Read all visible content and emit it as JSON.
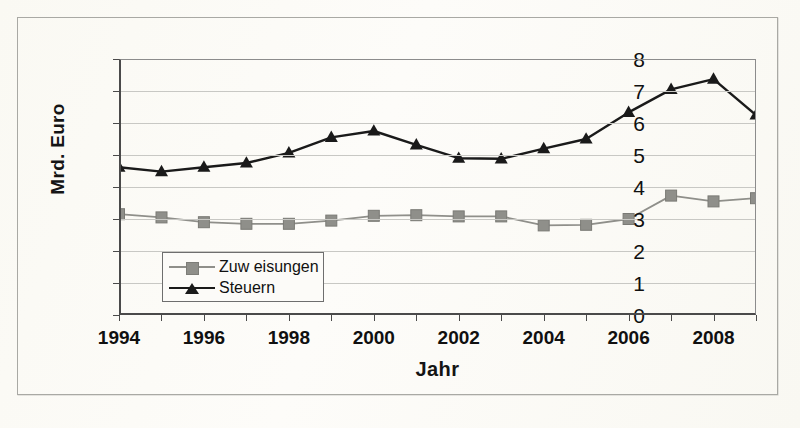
{
  "chart_data": {
    "type": "line",
    "title": "",
    "xlabel": "Jahr",
    "ylabel": "Mrd. Euro",
    "x": [
      1994,
      1995,
      1996,
      1997,
      1998,
      1999,
      2000,
      2001,
      2002,
      2003,
      2004,
      2005,
      2006,
      2007,
      2008,
      2009
    ],
    "xtick_labels": [
      "1994",
      "1996",
      "1998",
      "2000",
      "2002",
      "2004",
      "2006",
      "2008"
    ],
    "xtick_values": [
      1994,
      1996,
      1998,
      2000,
      2002,
      2004,
      2006,
      2008
    ],
    "ytick_labels": [
      "0",
      "1",
      "2",
      "3",
      "4",
      "5",
      "6",
      "7",
      "8"
    ],
    "ylim": [
      0,
      8
    ],
    "xlim": [
      1994,
      2009
    ],
    "grid": true,
    "legend_position": "lower-left-inside",
    "series": [
      {
        "name": "Zuw eisungen",
        "color": "#8f8f8a",
        "marker": "square",
        "marker_color": "#8f8f8a",
        "values": [
          3.15,
          3.05,
          2.9,
          2.85,
          2.85,
          2.95,
          3.1,
          3.12,
          3.08,
          3.08,
          2.8,
          2.82,
          3.0,
          3.73,
          3.55,
          3.65
        ]
      },
      {
        "name": "Steuern",
        "color": "#1a1a1a",
        "marker": "triangle",
        "marker_color": "#1a1a1a",
        "values": [
          4.62,
          4.48,
          4.62,
          4.75,
          5.07,
          5.55,
          5.75,
          5.32,
          4.9,
          4.88,
          5.2,
          5.5,
          6.33,
          7.05,
          7.37,
          6.25
        ]
      }
    ]
  },
  "axes": {
    "y_title": "Mrd. Euro",
    "x_title": "Jahr"
  },
  "legend": {
    "items": [
      {
        "label": "Zuw eisungen",
        "marker": "square-marker",
        "color": "#8f8f8a"
      },
      {
        "label": "Steuern",
        "marker": "triangle-marker",
        "color": "#1a1a1a"
      }
    ]
  },
  "colors": {
    "background": "#fbfaf7",
    "frame": "#a9a9a4",
    "axis": "#4a4a4a",
    "gridline": "#c8c8c4",
    "series_gray": "#8f8f8a",
    "series_black": "#1a1a1a"
  }
}
